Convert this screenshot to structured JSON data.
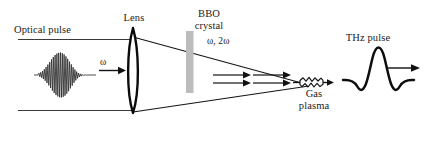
{
  "figure": {
    "background_color": "#ffffff",
    "stroke_color": "#111111",
    "crystal_color": "#b9b9b9",
    "width": 430,
    "height": 146
  },
  "labels": {
    "optical_pulse": "Optical pulse",
    "lens": "Lens",
    "bbo_crystal": "BBO\ncrystal",
    "bbo_crystal_line1": "BBO",
    "bbo_crystal_line2": "crystal",
    "omega": "ω",
    "omega_2omega": "ω, 2ω",
    "gas_plasma_line1": "Gas",
    "gas_plasma_line2": "plasma",
    "thz_pulse": "THz pulse"
  },
  "elements": {
    "optical_pulse_waveform": "gaussian-enveloped oscillating wave packet",
    "lens_shape": "tall narrow biconvex lens",
    "bbo_crystal_shape": "grey vertical rectangular bar",
    "beam_arrows": "two horizontal right-pointing arrows for omega and 2omega",
    "plasma_filament": "small jagged ellipse filament at beam focus",
    "thz_waveform": "single-cycle pulse with central peak and two side dips",
    "thz_direction_arrow": "right-pointing arrow"
  }
}
